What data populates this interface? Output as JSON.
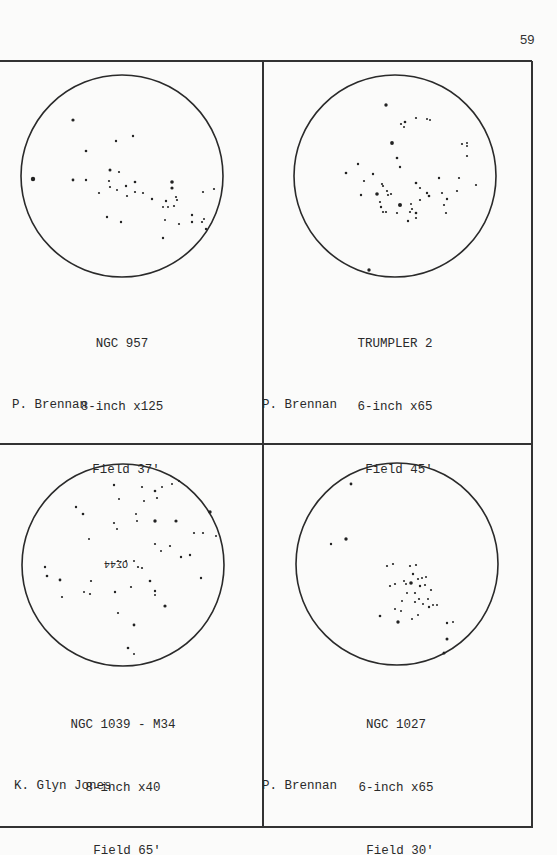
{
  "page_number": "59",
  "panels": [
    {
      "object": "NGC 957",
      "telescope": "8-inch x125",
      "field": "Field 37'",
      "observer": "P. Brennan",
      "circle": {
        "cx": 122,
        "cy": 176,
        "r": 101
      },
      "stars": [
        [
          73,
          120,
          1.6
        ],
        [
          33,
          179,
          2.2
        ],
        [
          73,
          180,
          1.4
        ],
        [
          86,
          151,
          1.3
        ],
        [
          86,
          180,
          1.2
        ],
        [
          116,
          141,
          1.2
        ],
        [
          133,
          136,
          1.2
        ],
        [
          110,
          170,
          1.5
        ],
        [
          119,
          172,
          1.1
        ],
        [
          109,
          181,
          1.1
        ],
        [
          110,
          187,
          1.1
        ],
        [
          117,
          190,
          1.0
        ],
        [
          99,
          193,
          1.1
        ],
        [
          126,
          186,
          1.2
        ],
        [
          135,
          182,
          1.3
        ],
        [
          135,
          192,
          1.1
        ],
        [
          127,
          196,
          1.1
        ],
        [
          143,
          193,
          1.1
        ],
        [
          152,
          199,
          1.2
        ],
        [
          172,
          182,
          1.8
        ],
        [
          172,
          188,
          1.6
        ],
        [
          166,
          201,
          1.2
        ],
        [
          176,
          197,
          1.1
        ],
        [
          177,
          200,
          1.1
        ],
        [
          163,
          207,
          1.0
        ],
        [
          168,
          207,
          1.0
        ],
        [
          174,
          206,
          1.1
        ],
        [
          165,
          220,
          1.0
        ],
        [
          179,
          224,
          1.1
        ],
        [
          192,
          215,
          1.2
        ],
        [
          192,
          222,
          1.2
        ],
        [
          202,
          222,
          1.1
        ],
        [
          204,
          219,
          1.0
        ],
        [
          206,
          229,
          1.2
        ],
        [
          203,
          192,
          1.1
        ],
        [
          214,
          189,
          1.1
        ],
        [
          107,
          217,
          1.2
        ],
        [
          121,
          222,
          1.2
        ],
        [
          163,
          238,
          1.2
        ]
      ]
    },
    {
      "object": "TRUMPLER 2",
      "telescope": "6-inch x65",
      "field": "Field 45'",
      "observer": "P. Brennan",
      "circle": {
        "cx": 395,
        "cy": 176,
        "r": 101
      },
      "stars": [
        [
          386,
          105,
          1.7
        ],
        [
          401,
          124,
          1.1
        ],
        [
          405,
          122,
          1.3
        ],
        [
          404,
          127,
          1.0
        ],
        [
          416,
          118,
          1.1
        ],
        [
          427,
          119,
          1.0
        ],
        [
          430,
          120,
          1.0
        ],
        [
          392,
          143,
          1.9
        ],
        [
          397,
          158,
          1.3
        ],
        [
          400,
          167,
          1.2
        ],
        [
          358,
          164,
          1.2
        ],
        [
          346,
          173,
          1.3
        ],
        [
          373,
          174,
          1.2
        ],
        [
          364,
          181,
          1.1
        ],
        [
          382,
          184,
          1.1
        ],
        [
          383,
          186,
          1.1
        ],
        [
          361,
          195,
          1.2
        ],
        [
          377,
          194,
          1.8
        ],
        [
          387,
          191,
          1.1
        ],
        [
          388,
          195,
          1.1
        ],
        [
          391,
          194,
          1.1
        ],
        [
          380,
          202,
          1.1
        ],
        [
          381,
          207,
          1.2
        ],
        [
          383,
          212,
          1.1
        ],
        [
          386,
          212,
          1.1
        ],
        [
          400,
          205,
          2.0
        ],
        [
          397,
          213,
          1.1
        ],
        [
          410,
          212,
          1.1
        ],
        [
          411,
          204,
          1.0
        ],
        [
          412,
          209,
          1.1
        ],
        [
          416,
          213,
          1.3
        ],
        [
          416,
          218,
          1.1
        ],
        [
          408,
          221,
          1.2
        ],
        [
          416,
          183,
          1.3
        ],
        [
          420,
          188,
          1.1
        ],
        [
          427,
          193,
          1.2
        ],
        [
          429,
          196,
          1.3
        ],
        [
          420,
          200,
          1.1
        ],
        [
          439,
          178,
          1.2
        ],
        [
          442,
          193,
          1.1
        ],
        [
          447,
          199,
          1.2
        ],
        [
          444,
          205,
          1.1
        ],
        [
          446,
          213,
          1.1
        ],
        [
          457,
          191,
          1.1
        ],
        [
          459,
          178,
          1.1
        ],
        [
          462,
          144,
          1.1
        ],
        [
          467,
          143,
          1.0
        ],
        [
          467,
          146,
          1.0
        ],
        [
          467,
          156,
          1.1
        ],
        [
          476,
          185,
          1.1
        ],
        [
          369,
          270,
          1.7
        ]
      ]
    },
    {
      "object": "NGC 1039 - M34",
      "telescope": "8-inch x40",
      "field": "Field 65'",
      "observer": "K. Glyn Jones",
      "circle": {
        "cx": 123,
        "cy": 565,
        "r": 101
      },
      "label_in_field": "OΣ44",
      "stars": [
        [
          114,
          485,
          1.2
        ],
        [
          119,
          499,
          1.0
        ],
        [
          144,
          501,
          1.0
        ],
        [
          142,
          487,
          1.1
        ],
        [
          155,
          491,
          1.3
        ],
        [
          157,
          498,
          1.1
        ],
        [
          162,
          487,
          1.0
        ],
        [
          172,
          484,
          1.0
        ],
        [
          179,
          481,
          1.1
        ],
        [
          210,
          512,
          1.7
        ],
        [
          176,
          521,
          1.6
        ],
        [
          155,
          521,
          1.7
        ],
        [
          136,
          514,
          1.0
        ],
        [
          137,
          521,
          1.0
        ],
        [
          114,
          523,
          1.1
        ],
        [
          117,
          529,
          1.0
        ],
        [
          76,
          507,
          1.2
        ],
        [
          83,
          514,
          1.3
        ],
        [
          89,
          539,
          1.0
        ],
        [
          155,
          544,
          1.1
        ],
        [
          161,
          551,
          1.0
        ],
        [
          170,
          546,
          1.1
        ],
        [
          194,
          533,
          1.1
        ],
        [
          203,
          533,
          1.1
        ],
        [
          216,
          536,
          1.0
        ],
        [
          181,
          557,
          1.2
        ],
        [
          190,
          555,
          1.2
        ],
        [
          118,
          561,
          1.0
        ],
        [
          126,
          561,
          1.0
        ],
        [
          134,
          561,
          1.0
        ],
        [
          138,
          567,
          1.1
        ],
        [
          142,
          568,
          1.1
        ],
        [
          150,
          581,
          1.3
        ],
        [
          155,
          591,
          1.2
        ],
        [
          155,
          595,
          1.0
        ],
        [
          131,
          587,
          1.1
        ],
        [
          115,
          592,
          1.2
        ],
        [
          165,
          606,
          1.6
        ],
        [
          201,
          578,
          1.2
        ],
        [
          45,
          567,
          1.2
        ],
        [
          47,
          576,
          1.3
        ],
        [
          60,
          580,
          1.4
        ],
        [
          62,
          597,
          1.1
        ],
        [
          90,
          594,
          1.1
        ],
        [
          91,
          581,
          1.1
        ],
        [
          84,
          592,
          1.0
        ],
        [
          118,
          613,
          1.1
        ],
        [
          134,
          625,
          1.4
        ],
        [
          128,
          648,
          1.3
        ],
        [
          134,
          654,
          1.0
        ]
      ]
    },
    {
      "object": "NGC 1027",
      "telescope": "6-inch x65",
      "field": "Field 30'",
      "observer": "P. Brennan",
      "circle": {
        "cx": 397,
        "cy": 564,
        "r": 101
      },
      "stars": [
        [
          351,
          484,
          1.4
        ],
        [
          346,
          539,
          1.7
        ],
        [
          331,
          544,
          1.2
        ],
        [
          387,
          566,
          1.1
        ],
        [
          393,
          564,
          1.1
        ],
        [
          410,
          566,
          1.1
        ],
        [
          416,
          565,
          1.1
        ],
        [
          413,
          574,
          1.2
        ],
        [
          418,
          579,
          1.1
        ],
        [
          422,
          578,
          1.0
        ],
        [
          426,
          577,
          1.0
        ],
        [
          404,
          581,
          1.0
        ],
        [
          406,
          584,
          1.0
        ],
        [
          411,
          583,
          1.8
        ],
        [
          420,
          586,
          1.2
        ],
        [
          425,
          585,
          1.1
        ],
        [
          431,
          590,
          1.1
        ],
        [
          390,
          586,
          1.1
        ],
        [
          395,
          584,
          1.1
        ],
        [
          407,
          593,
          1.0
        ],
        [
          402,
          601,
          1.0
        ],
        [
          415,
          593,
          1.1
        ],
        [
          415,
          602,
          1.1
        ],
        [
          419,
          599,
          1.1
        ],
        [
          428,
          599,
          1.0
        ],
        [
          433,
          605,
          1.0
        ],
        [
          437,
          605,
          1.0
        ],
        [
          423,
          604,
          1.0
        ],
        [
          395,
          609,
          1.0
        ],
        [
          401,
          611,
          1.0
        ],
        [
          418,
          615,
          1.0
        ],
        [
          412,
          619,
          1.0
        ],
        [
          429,
          607,
          1.2
        ],
        [
          380,
          616,
          1.3
        ],
        [
          398,
          622,
          1.7
        ],
        [
          447,
          623,
          1.2
        ],
        [
          453,
          622,
          1.0
        ],
        [
          447,
          639,
          1.5
        ],
        [
          444,
          653,
          1.5
        ]
      ]
    }
  ]
}
